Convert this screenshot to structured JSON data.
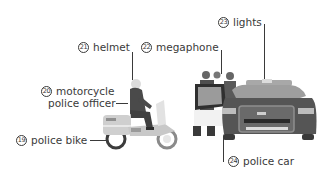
{
  "labels": [
    {
      "id": "helmet",
      "number": "21",
      "text": "helmet"
    },
    {
      "id": "megaphone",
      "number": "22",
      "text": "megaphone"
    },
    {
      "id": "lights",
      "number": "23",
      "text": "lights"
    },
    {
      "id": "motorcycle-police-officer",
      "number": "20",
      "line1": "motorcycle",
      "line2": "police officer"
    },
    {
      "id": "police-bike",
      "number": "19",
      "text": "police bike"
    },
    {
      "id": "police-car",
      "number": "24",
      "text": "police car"
    }
  ],
  "colors": {
    "text": "#3a3a3a",
    "car_body": "#555555",
    "car_light": "#bdbdbd",
    "bike_body": "#c8c8c8",
    "uniform": "#4a4a4a"
  }
}
